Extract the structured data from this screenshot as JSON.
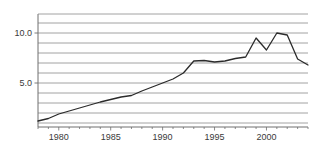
{
  "chart_data": {
    "type": "line",
    "title": "",
    "subtitle": "",
    "xlabel": "",
    "ylabel": "",
    "xlim": [
      1978,
      2004
    ],
    "ylim": [
      0.6,
      11.9
    ],
    "grid": true,
    "grid_axis": "y",
    "grid_interval": 1,
    "legend": false,
    "legend_position": "none",
    "ytick_labels": [
      "10.0",
      "5.0"
    ],
    "ytick_values": [
      10,
      5
    ],
    "xtick_labels": [
      "1980",
      "1985",
      "1990",
      "1995",
      "2000"
    ],
    "xtick_values": [
      1980,
      1985,
      1990,
      1995,
      2000
    ],
    "xminor_interval": 1,
    "line_color": "#2b2b2b",
    "grid_color": "#8c8c8c",
    "axis_color": "#6e6e6e",
    "series": [
      {
        "name": "series-1",
        "x": [
          1978,
          1979,
          1980,
          1981,
          1982,
          1983,
          1984,
          1985,
          1986,
          1987,
          1988,
          1989,
          1990,
          1991,
          1992,
          1993,
          1994,
          1995,
          1996,
          1997,
          1998,
          1999,
          2000,
          2001,
          2002,
          2003,
          2004
        ],
        "values": [
          1.2,
          1.45,
          1.9,
          2.2,
          2.5,
          2.8,
          3.1,
          3.35,
          3.6,
          3.75,
          4.2,
          4.6,
          5.0,
          5.4,
          6.0,
          7.2,
          7.25,
          7.1,
          7.2,
          7.45,
          7.6,
          9.5,
          8.3,
          10.0,
          9.8,
          7.4,
          6.8
        ]
      }
    ]
  }
}
